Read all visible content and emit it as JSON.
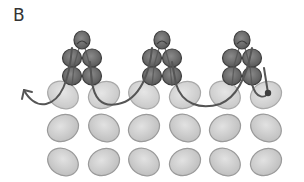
{
  "figure": {
    "panel_label": "B",
    "colors": {
      "background": "#ffffff",
      "light_bead_fill": "#cfcfcf",
      "light_bead_stroke": "#9a9a9a",
      "dark_bead_fill": "#6e6e6e",
      "dark_bead_stroke": "#3e3e3e",
      "thread": "#555555"
    },
    "light_bead_grid": {
      "columns_x": [
        63,
        104,
        144,
        185,
        225,
        266
      ],
      "rows_y": [
        95,
        128,
        162
      ],
      "rx": 16,
      "ry": 13
    },
    "dark_bead_clusters": [
      {
        "center_x": 82
      },
      {
        "center_x": 162
      },
      {
        "center_x": 242
      }
    ],
    "thread_arrow": {
      "start": [
        268,
        93
      ],
      "end": [
        24,
        90
      ],
      "direction": "right-to-left"
    }
  }
}
